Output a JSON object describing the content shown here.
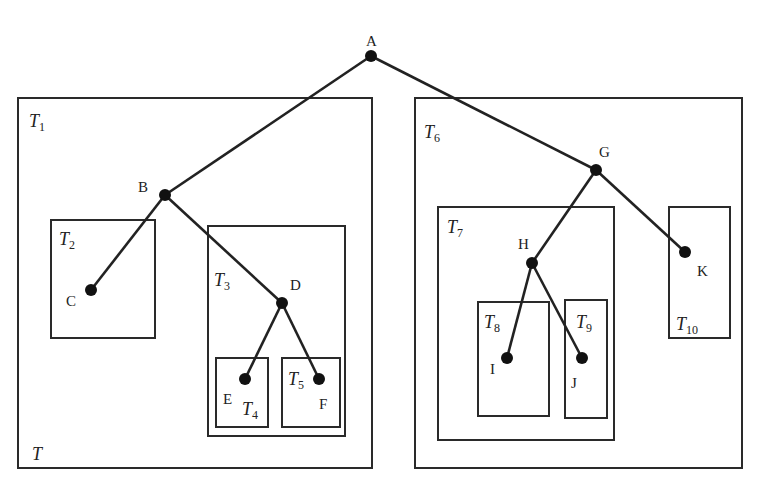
{
  "diagram": {
    "type": "tree-with-subtree-boxes",
    "nodes": [
      {
        "id": "A",
        "label": "A",
        "x": 371,
        "y": 56,
        "lx": 366,
        "ly": 46
      },
      {
        "id": "B",
        "label": "B",
        "x": 165,
        "y": 195,
        "lx": 138,
        "ly": 192
      },
      {
        "id": "C",
        "label": "C",
        "x": 91,
        "y": 290,
        "lx": 66,
        "ly": 306
      },
      {
        "id": "D",
        "label": "D",
        "x": 282,
        "y": 303,
        "lx": 290,
        "ly": 290
      },
      {
        "id": "E",
        "label": "E",
        "x": 245,
        "y": 379,
        "lx": 223,
        "ly": 404
      },
      {
        "id": "F",
        "label": "F",
        "x": 319,
        "y": 379,
        "lx": 319,
        "ly": 409
      },
      {
        "id": "G",
        "label": "G",
        "x": 596,
        "y": 170,
        "lx": 599,
        "ly": 157
      },
      {
        "id": "H",
        "label": "H",
        "x": 532,
        "y": 263,
        "lx": 518,
        "ly": 249
      },
      {
        "id": "I",
        "label": "I",
        "x": 507,
        "y": 358,
        "lx": 490,
        "ly": 374
      },
      {
        "id": "J",
        "label": "J",
        "x": 582,
        "y": 358,
        "lx": 571,
        "ly": 388
      },
      {
        "id": "K",
        "label": "K",
        "x": 685,
        "y": 252,
        "lx": 697,
        "ly": 276
      }
    ],
    "edges": [
      [
        "A",
        "B"
      ],
      [
        "A",
        "G"
      ],
      [
        "B",
        "C"
      ],
      [
        "B",
        "D"
      ],
      [
        "D",
        "E"
      ],
      [
        "D",
        "F"
      ],
      [
        "G",
        "H"
      ],
      [
        "G",
        "K"
      ],
      [
        "H",
        "I"
      ],
      [
        "H",
        "J"
      ]
    ],
    "subtrees": [
      {
        "id": "T1",
        "base": "T",
        "sub": "1",
        "x": 18,
        "y": 98,
        "w": 354,
        "h": 370,
        "lx": 29,
        "ly": 127
      },
      {
        "id": "T2",
        "base": "T",
        "sub": "2",
        "x": 51,
        "y": 220,
        "w": 104,
        "h": 118,
        "lx": 59,
        "ly": 245
      },
      {
        "id": "T3",
        "base": "T",
        "sub": "3",
        "x": 208,
        "y": 226,
        "w": 137,
        "h": 210,
        "lx": 214,
        "ly": 286
      },
      {
        "id": "T4",
        "base": "T",
        "sub": "4",
        "x": 216,
        "y": 358,
        "w": 52,
        "h": 69,
        "lx": 242,
        "ly": 415
      },
      {
        "id": "T5",
        "base": "T",
        "sub": "5",
        "x": 282,
        "y": 358,
        "w": 58,
        "h": 69,
        "lx": 288,
        "ly": 385
      },
      {
        "id": "T6",
        "base": "T",
        "sub": "6",
        "x": 415,
        "y": 98,
        "w": 327,
        "h": 370,
        "lx": 424,
        "ly": 138
      },
      {
        "id": "T7",
        "base": "T",
        "sub": "7",
        "x": 438,
        "y": 207,
        "w": 176,
        "h": 233,
        "lx": 447,
        "ly": 233
      },
      {
        "id": "T8",
        "base": "T",
        "sub": "8",
        "x": 478,
        "y": 302,
        "w": 71,
        "h": 114,
        "lx": 484,
        "ly": 328
      },
      {
        "id": "T9",
        "base": "T",
        "sub": "9",
        "x": 565,
        "y": 300,
        "w": 42,
        "h": 118,
        "lx": 576,
        "ly": 328
      },
      {
        "id": "T10",
        "base": "T",
        "sub": "10",
        "x": 669,
        "y": 207,
        "w": 61,
        "h": 131,
        "lx": 676,
        "ly": 330
      }
    ],
    "whole_tree_label": {
      "text": "T",
      "x": 32,
      "y": 460
    }
  }
}
